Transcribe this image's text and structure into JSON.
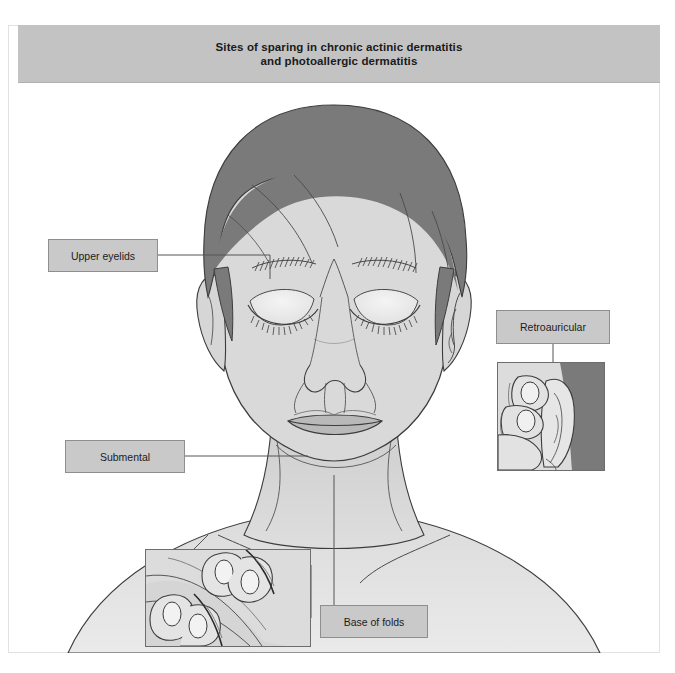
{
  "figure": {
    "title_line1": "Sites of sparing in chronic actinic dermatitis",
    "title_line2": "and photoallergic dermatitis",
    "title_bar_color": "#c3c3c3",
    "background_color": "#ffffff"
  },
  "palette": {
    "hair": "#7a7a7a",
    "skin": "#d8d8d8",
    "skin_light": "#e8e8e8",
    "skin_shadow": "#c8c8c8",
    "spared_highlight": "#f2f2f2",
    "lips": "#b9b9b9",
    "outline": "#3c3c3c",
    "label_fill": "#c9c9c9",
    "label_stroke": "#8e8e8e",
    "leader_line": "#555555",
    "inset_border": "#6d6d6d"
  },
  "labels": [
    {
      "id": "upper-eyelids",
      "text": "Upper eyelids"
    },
    {
      "id": "submental",
      "text": "Submental"
    },
    {
      "id": "retroauricular",
      "text": "Retroauricular"
    },
    {
      "id": "base-of-folds",
      "text": "Base of folds"
    }
  ],
  "illustration": {
    "subject": "frontal view of a human head, face and neck with eyes closed",
    "spared_sites": [
      "upper eyelids",
      "submental area under the chin",
      "retroauricular area behind the ear",
      "base of skin folds on the neck"
    ],
    "insets": [
      {
        "id": "retroauricular-inset",
        "description": "fingers pulling the ear forward to expose the retroauricular skin"
      },
      {
        "id": "base-of-folds-inset",
        "description": "two pairs of fingers stretching a neck skin fold apart to show its base"
      }
    ]
  }
}
